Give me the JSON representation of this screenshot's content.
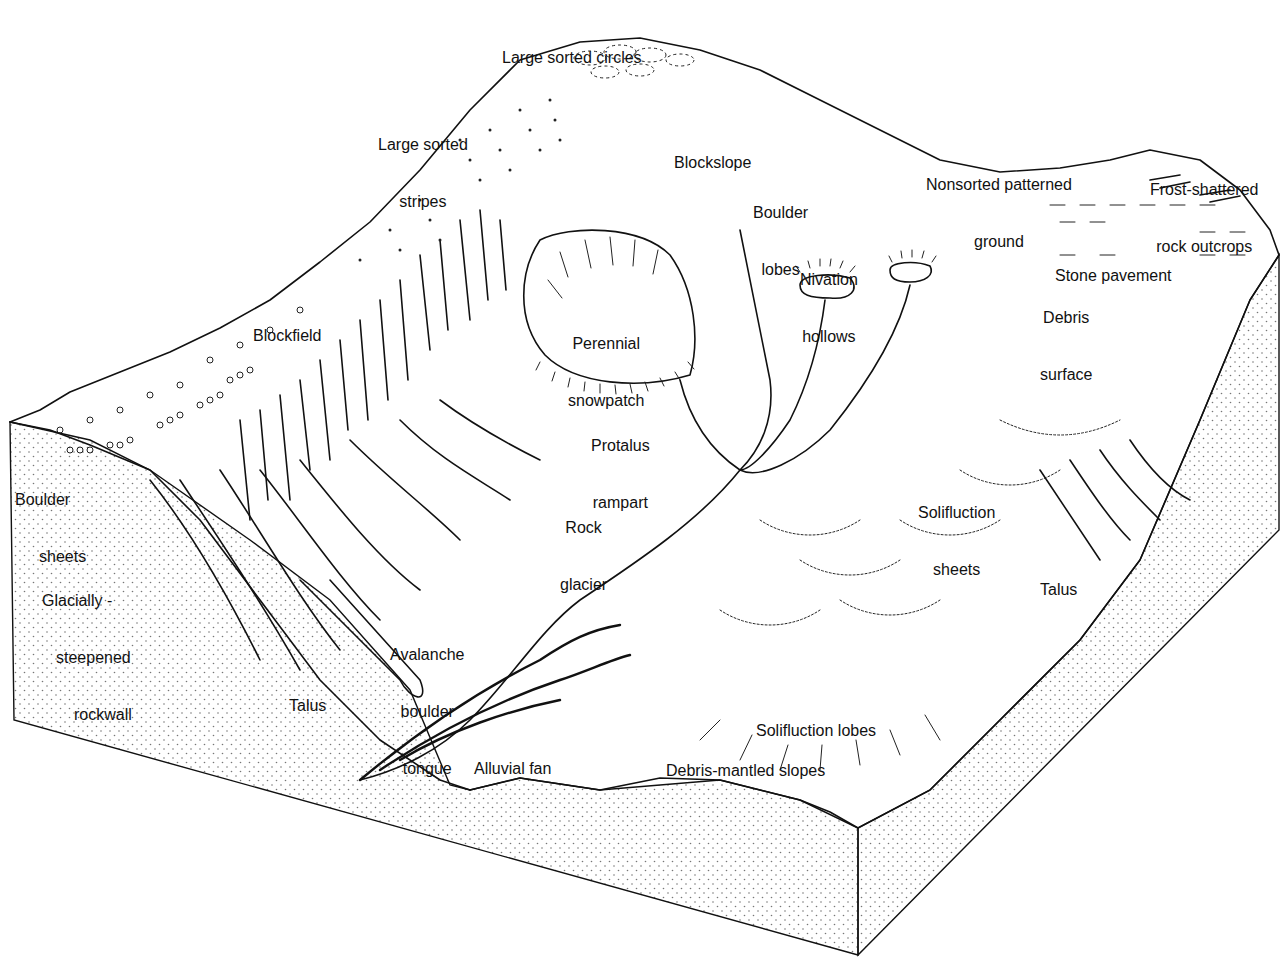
{
  "figure": {
    "type": "block diagram"
  },
  "colors": {
    "ink": "#111111",
    "background": "#ffffff",
    "stipple": "#777777"
  },
  "labels": {
    "large_sorted_circles": "Large sorted circles",
    "large_sorted_stripes_1": "Large sorted",
    "large_sorted_stripes_2": "stripes",
    "blockslope": "Blockslope",
    "boulder_lobes_1": "Boulder",
    "boulder_lobes_2": "lobes",
    "nonsorted_patterned_ground_1": "Nonsorted patterned",
    "nonsorted_patterned_ground_2": "ground",
    "frost_shattered_1": "Frost-shattered",
    "frost_shattered_2": "rock outcrops",
    "stone_pavement": "Stone pavement",
    "nivation_hollows_1": "Nivation",
    "nivation_hollows_2": "hollows",
    "debris_surface_1": "Debris",
    "debris_surface_2": "surface",
    "blockfield": "Blockfield",
    "perennial_snowpatch_1": "Perennial",
    "perennial_snowpatch_2": "snowpatch",
    "protalus_rampart_1": "Protalus",
    "protalus_rampart_2": "rampart",
    "boulder_sheets_1": "Boulder",
    "boulder_sheets_2": "sheets",
    "rock_glacier_1": "Rock",
    "rock_glacier_2": "glacier",
    "solifluction_sheets_1": "Solifluction",
    "solifluction_sheets_2": "sheets",
    "glacially_steepened_1": "Glacially -",
    "glacially_steepened_2": "steepened",
    "glacially_steepened_3": "rockwall",
    "talus_right": "Talus",
    "avalanche_tongue_1": "Avalanche",
    "avalanche_tongue_2": "boulder",
    "avalanche_tongue_3": "tongue",
    "talus_left": "Talus",
    "solifluction_lobes": "Solifluction lobes",
    "alluvial_fan": "Alluvial fan",
    "debris_mantled_slopes": "Debris-mantled slopes"
  }
}
